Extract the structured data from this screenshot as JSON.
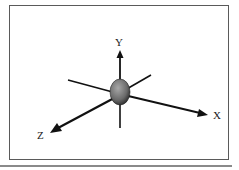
{
  "diagram": {
    "type": "3d-coordinate-axes",
    "axes": [
      {
        "name": "x-axis",
        "label": "X"
      },
      {
        "name": "y-axis",
        "label": "Y"
      },
      {
        "name": "z-axis",
        "label": "Z"
      }
    ],
    "center_object": "ellipsoid",
    "colors": {
      "frame": "#5a5a5a",
      "axis": "#111111",
      "ellipsoid_light": "#9a9a9a",
      "ellipsoid_dark": "#3a3a3a",
      "rule": "#8a8a8a"
    }
  }
}
